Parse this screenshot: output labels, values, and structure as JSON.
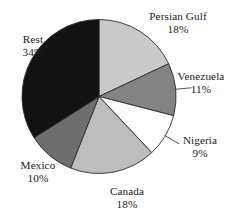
{
  "chart_data": {
    "type": "pie",
    "title": "",
    "subtitle": "",
    "xlabel": "",
    "ylabel": "",
    "legend_position": "none",
    "grid": false,
    "units": "percent",
    "start_angle_deg": 0,
    "direction": "clockwise",
    "categories": [
      "Persian Gulf",
      "Venezuela",
      "Nigeria",
      "Canada",
      "Mexico",
      "Rest"
    ],
    "values": [
      18,
      11,
      9,
      18,
      10,
      34
    ],
    "slices": [
      {
        "label": "Persian Gulf",
        "value": 18,
        "value_text": "18%",
        "color": "#c9c9c9",
        "leader_line": false
      },
      {
        "label": "Venezuela",
        "value": 11,
        "value_text": "11%",
        "color": "#838383",
        "leader_line": true
      },
      {
        "label": "Nigeria",
        "value": 9,
        "value_text": "9%",
        "color": "#ffffff",
        "leader_line": true
      },
      {
        "label": "Canada",
        "value": 18,
        "value_text": "18%",
        "color": "#bdbdbd",
        "leader_line": false
      },
      {
        "label": "Mexico",
        "value": 10,
        "value_text": "10%",
        "color": "#6e6e6e",
        "leader_line": false
      },
      {
        "label": "Rest",
        "value": 34,
        "value_text": "34%",
        "color": "#121212",
        "leader_line": false
      }
    ],
    "colors": {
      "outline": "#2b2b2b",
      "background": "#ffffff",
      "text": "#1a1a1a"
    }
  }
}
